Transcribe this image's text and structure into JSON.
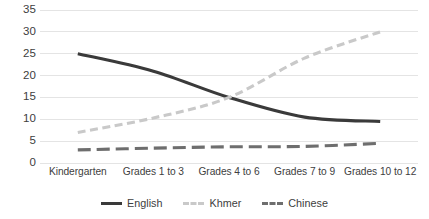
{
  "chart_data": {
    "type": "line",
    "title": "",
    "subtitle": "",
    "xlabel": "",
    "ylabel": "",
    "categories": [
      "Kindergarten",
      "Grades 1 to 3",
      "Grades 4 to 6",
      "Grades 7 to 9",
      "Grades 10 to 12"
    ],
    "series": [
      {
        "name": "English",
        "values": [
          25,
          21,
          15,
          10.5,
          9.5
        ],
        "color": "#3a3a3a",
        "style": "solid",
        "width": 3.1
      },
      {
        "name": "Khmer",
        "values": [
          7,
          10.3,
          15,
          24,
          30
        ],
        "color": "#c9c9c9",
        "style": "dashed",
        "width": 3.1
      },
      {
        "name": "Chinese",
        "values": [
          3,
          3.4,
          3.7,
          3.8,
          4.5
        ],
        "color": "#6e6e6e",
        "style": "long-dash",
        "width": 3.1
      }
    ],
    "ylim": [
      0,
      35
    ],
    "ytick_values": [
      35,
      30,
      25,
      20,
      15,
      10,
      5,
      0
    ],
    "ytick_labels": [
      "35",
      "30",
      "25",
      "20",
      "15",
      "10",
      "5",
      "0"
    ],
    "grid": {
      "horizontal": true,
      "vertical": false,
      "color": "#e4e4e4"
    },
    "legend": {
      "position": "bottom",
      "orientation": "horizontal"
    },
    "background": "#ffffff",
    "annotations": []
  },
  "legend": {
    "items": [
      {
        "label": "English"
      },
      {
        "label": "Khmer"
      },
      {
        "label": "Chinese"
      }
    ]
  }
}
